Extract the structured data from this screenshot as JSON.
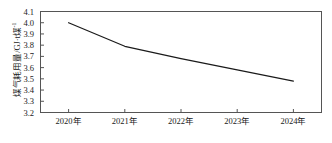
{
  "chart_data": {
    "type": "line",
    "title": "",
    "subtitle": "",
    "xlabel": "",
    "ylabel": "煤气耗用量/GJ·t煤⁻¹",
    "ylabel_main": "煤气耗用量/GJ·t煤",
    "ylabel_sup": "-1",
    "categories": [
      "2020年",
      "2021年",
      "2022年",
      "2023年",
      "2024年"
    ],
    "x": [
      2020,
      2021,
      2022,
      2023,
      2024
    ],
    "values": [
      4.0,
      3.79,
      3.68,
      3.58,
      3.48
    ],
    "series": [
      {
        "name": "煤气耗用量",
        "values": [
          4.0,
          3.79,
          3.68,
          3.58,
          3.48
        ],
        "color": "#1a1a1a"
      }
    ],
    "ylim": [
      3.2,
      4.1
    ],
    "yticks": [
      3.2,
      3.3,
      3.4,
      3.5,
      3.6,
      3.7,
      3.8,
      3.9,
      4.0,
      4.1
    ],
    "ytick_labels": [
      "3.2",
      "3.3",
      "3.4",
      "3.5",
      "3.6",
      "3.7",
      "3.8",
      "3.9",
      "4.0",
      "4.1"
    ],
    "xtick_labels": [
      "2020年",
      "2021年",
      "2022年",
      "2023年",
      "2024年"
    ],
    "grid": false,
    "legend": false,
    "legend_position": "none",
    "frame": true,
    "line_color": "#1a1a1a",
    "line_width": 1.2,
    "markers": false,
    "background": "#ffffff"
  }
}
